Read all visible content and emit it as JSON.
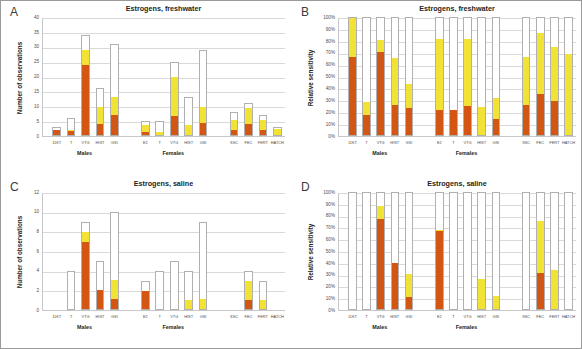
{
  "figure": {
    "width": 582,
    "height": 349,
    "colors": {
      "segment_low": "#d35712",
      "segment_mid": "#f2e236",
      "segment_high": "#ffffff",
      "bar_outline": "#b0b0b0",
      "gridline": "#d9d9d9",
      "text": "#231f20"
    },
    "group_labels": [
      "Males",
      "Females",
      ""
    ],
    "endpoints_male": [
      "11KT",
      "T",
      "VTG",
      "HIST",
      "GSI"
    ],
    "endpoints_female": [
      "E2",
      "T",
      "VTG",
      "HIST",
      "GSI"
    ],
    "endpoints_repro": [
      "SSC",
      "FEC",
      "FERT",
      "HATCH"
    ]
  },
  "panels": [
    {
      "letter": "A",
      "title": "Estrogens, freshwater",
      "ylabel": "Number of observations",
      "chart_data": {
        "type": "bar",
        "title": "Estrogens, freshwater",
        "xlabel": "",
        "ylabel": "Number of observations",
        "ylim": [
          0,
          40
        ],
        "ytick_labels": [
          "0",
          "5",
          "10",
          "15",
          "20",
          "25",
          "30",
          "35",
          "40"
        ],
        "ytick_values": [
          0,
          5,
          10,
          15,
          20,
          25,
          30,
          35,
          40
        ],
        "grid": true,
        "legend": "none",
        "stacked": true,
        "groups": [
          {
            "label": "Males",
            "categories": [
              "11KT",
              "T",
              "VTG",
              "HIST",
              "GSI"
            ]
          },
          {
            "label": "Females",
            "categories": [
              "E2",
              "T",
              "VTG",
              "HIST",
              "GSI"
            ]
          },
          {
            "label": "",
            "categories": [
              "SSC",
              "FEC",
              "FERT",
              "HATCH"
            ]
          }
        ],
        "categories": [
          "11KT",
          "T",
          "VTG",
          "HIST",
          "GSI",
          "E2",
          "T",
          "VTG",
          "HIST",
          "GSI",
          "SSC",
          "FEC",
          "FERT",
          "HATCH"
        ],
        "series": [
          {
            "name": "low",
            "color": "#d35712",
            "values": [
              2,
              1.5,
              24,
              4,
              7,
              1,
              0,
              6.5,
              0,
              4,
              2,
              4,
              2,
              0
            ]
          },
          {
            "name": "mid",
            "color": "#f2e236",
            "values": [
              0,
              0.5,
              5,
              6,
              6,
              3,
              1,
              13.5,
              3.5,
              5.5,
              3.5,
              5.5,
              3.5,
              2.5
            ]
          },
          {
            "name": "high",
            "color": "#ffffff",
            "values": [
              1,
              4,
              5,
              6,
              18,
              1,
              4,
              5,
              9.5,
              20,
              2.5,
              1.5,
              1.5,
              0.5
            ]
          }
        ],
        "totals": [
          3,
          6,
          34,
          16,
          31,
          5,
          5,
          25,
          13,
          29,
          8,
          11,
          7,
          3
        ]
      }
    },
    {
      "letter": "B",
      "title": "Estrogens, freshwater",
      "ylabel": "Relative sensitivity",
      "chart_data": {
        "type": "bar",
        "title": "Estrogens, freshwater",
        "xlabel": "",
        "ylabel": "Relative sensitivity",
        "ylim": [
          0,
          100
        ],
        "ytick_labels": [
          "0%",
          "10%",
          "20%",
          "30%",
          "40%",
          "50%",
          "60%",
          "70%",
          "80%",
          "90%",
          "100%"
        ],
        "ytick_values": [
          0,
          10,
          20,
          30,
          40,
          50,
          60,
          70,
          80,
          90,
          100
        ],
        "grid": true,
        "legend": "none",
        "stacked": true,
        "unit": "%",
        "groups": [
          {
            "label": "Males",
            "categories": [
              "11KT",
              "T",
              "VTG",
              "HIST",
              "GSI"
            ]
          },
          {
            "label": "Females",
            "categories": [
              "E2",
              "T",
              "VTG",
              "HIST",
              "GSI"
            ]
          },
          {
            "label": "",
            "categories": [
              "SSC",
              "FEC",
              "FERT",
              "HATCH"
            ]
          }
        ],
        "categories": [
          "11KT",
          "T",
          "VTG",
          "HIST",
          "GSI",
          "E2",
          "T",
          "VTG",
          "HIST",
          "GSI",
          "SSC",
          "FEC",
          "FERT",
          "HATCH"
        ],
        "series": [
          {
            "name": "low",
            "color": "#d35712",
            "values": [
              67,
              17,
              71,
              26,
              23,
              21,
              21,
              25,
              0,
              14,
              26,
              35,
              29,
              0
            ]
          },
          {
            "name": "mid",
            "color": "#f2e236",
            "values": [
              33,
              11,
              10,
              40,
              21,
              61,
              0,
              57,
              24,
              18,
              41,
              52,
              46,
              69
            ]
          },
          {
            "name": "high",
            "color": "#ffffff",
            "values": [
              0,
              72,
              19,
              34,
              56,
              18,
              79,
              18,
              76,
              68,
              33,
              13,
              25,
              31
            ]
          }
        ],
        "totals": [
          100,
          100,
          100,
          100,
          100,
          100,
          100,
          100,
          100,
          100,
          100,
          100,
          100,
          100
        ]
      }
    },
    {
      "letter": "C",
      "title": "Estrogens, saline",
      "ylabel": "Number of observations",
      "chart_data": {
        "type": "bar",
        "title": "Estrogens, saline",
        "xlabel": "",
        "ylabel": "Number of observations",
        "ylim": [
          0,
          12
        ],
        "ytick_labels": [
          "0",
          "2",
          "4",
          "6",
          "8",
          "10",
          "12"
        ],
        "ytick_values": [
          0,
          2,
          4,
          6,
          8,
          10,
          12
        ],
        "grid": true,
        "legend": "none",
        "stacked": true,
        "groups": [
          {
            "label": "Males",
            "categories": [
              "11KT",
              "T",
              "VTG",
              "HIST",
              "GSI"
            ]
          },
          {
            "label": "Females",
            "categories": [
              "E2",
              "T",
              "VTG",
              "HIST",
              "GSI"
            ]
          },
          {
            "label": "",
            "categories": [
              "SSC",
              "FEC",
              "FERT",
              "HATCH"
            ]
          }
        ],
        "categories": [
          "11KT",
          "T",
          "VTG",
          "HIST",
          "GSI",
          "E2",
          "T",
          "VTG",
          "HIST",
          "GSI",
          "SSC",
          "FEC",
          "FERT",
          "HATCH"
        ],
        "series": [
          {
            "name": "low",
            "color": "#d35712",
            "values": [
              0,
              0,
              7,
              2,
              1,
              2,
              0,
              0,
              0,
              0,
              0,
              1,
              0,
              0
            ]
          },
          {
            "name": "mid",
            "color": "#f2e236",
            "values": [
              0,
              0,
              1,
              0,
              2,
              0,
              0,
              0,
              1,
              1,
              0,
              2,
              1,
              0
            ]
          },
          {
            "name": "high",
            "color": "#ffffff",
            "values": [
              0,
              4,
              1,
              3,
              7,
              1,
              4,
              5,
              3,
              8,
              0,
              1,
              2,
              0
            ]
          }
        ],
        "totals": [
          0,
          4,
          9,
          5,
          10,
          3,
          4,
          5,
          4,
          9,
          0,
          4,
          3,
          0
        ]
      }
    },
    {
      "letter": "D",
      "title": "Estrogens, saline",
      "ylabel": "Relative sensitivity",
      "chart_data": {
        "type": "bar",
        "title": "Estrogens, saline",
        "xlabel": "",
        "ylabel": "Relative sensitivity",
        "ylim": [
          0,
          100
        ],
        "ytick_labels": [
          "0%",
          "10%",
          "20%",
          "30%",
          "40%",
          "50%",
          "60%",
          "70%",
          "80%",
          "90%",
          "100%"
        ],
        "ytick_values": [
          0,
          10,
          20,
          30,
          40,
          50,
          60,
          70,
          80,
          90,
          100
        ],
        "grid": true,
        "legend": "none",
        "stacked": true,
        "unit": "%",
        "groups": [
          {
            "label": "Males",
            "categories": [
              "11KT",
              "T",
              "VTG",
              "HIST",
              "GSI"
            ]
          },
          {
            "label": "Females",
            "categories": [
              "E2",
              "T",
              "VTG",
              "HIST",
              "GSI"
            ]
          },
          {
            "label": "",
            "categories": [
              "SSC",
              "FEC",
              "FERT",
              "HATCH"
            ]
          }
        ],
        "categories": [
          "11KT",
          "T",
          "VTG",
          "HIST",
          "GSI",
          "E2",
          "T",
          "VTG",
          "HIST",
          "GSI",
          "SSC",
          "FEC",
          "FERT",
          "HATCH"
        ],
        "series": [
          {
            "name": "low",
            "color": "#d35712",
            "values": [
              0,
              0,
              78,
              40,
              10,
              67,
              0,
              0,
              0,
              0,
              0,
              31,
              0,
              0
            ]
          },
          {
            "name": "mid",
            "color": "#f2e236",
            "values": [
              0,
              0,
              11,
              0,
              20,
              1,
              0,
              0,
              26,
              11,
              0,
              45,
              34,
              0
            ]
          },
          {
            "name": "high",
            "color": "#ffffff",
            "values": [
              100,
              100,
              11,
              60,
              70,
              32,
              100,
              100,
              74,
              89,
              100,
              24,
              66,
              100
            ]
          }
        ],
        "totals": [
          100,
          100,
          100,
          100,
          100,
          100,
          100,
          100,
          100,
          100,
          100,
          100,
          100,
          100
        ]
      }
    }
  ]
}
